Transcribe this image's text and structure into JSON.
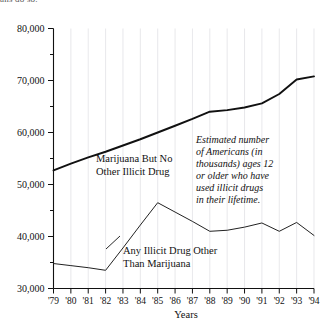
{
  "top_clipped_text": "ans do so.",
  "chart_data": {
    "type": "line",
    "title": "",
    "xlabel": "Years",
    "ylabel": "",
    "x": [
      "'79",
      "'80",
      "'81",
      "'82",
      "'83",
      "'84",
      "'85",
      "'86",
      "'87",
      "'88",
      "'89",
      "'90",
      "'91",
      "'92",
      "'93",
      "'94"
    ],
    "ylim": [
      30000,
      80000
    ],
    "ytick_values": [
      30000,
      40000,
      50000,
      60000,
      70000,
      80000
    ],
    "ytick_labels": [
      "30,000",
      "40,000",
      "50,000",
      "60,000",
      "70,000",
      "80,000"
    ],
    "yminor_values": [
      35000,
      45000,
      55000,
      65000,
      75000
    ],
    "grid": "vertical-only",
    "legend": "inline-labels",
    "series": [
      {
        "name": "Marijuana But No Other Illicit Drug",
        "values": [
          52700,
          54000,
          55200,
          56300,
          57500,
          58700,
          60000,
          61300,
          62600,
          64000,
          64300,
          64800,
          65600,
          67400,
          70200,
          70800
        ]
      },
      {
        "name": "Any Illicit Drug Other Than Marijuana",
        "values": [
          34800,
          34400,
          34000,
          33500,
          37800,
          42200,
          46500,
          44700,
          42900,
          41000,
          41200,
          41800,
          42600,
          41000,
          42700,
          40200
        ]
      }
    ],
    "annotations": [
      {
        "name": "estimate-note",
        "lines": [
          "Estimated number",
          "of Americans (in",
          "thousands) ages 12",
          "or older who have",
          "used illicit drugs",
          "in their lifetime."
        ]
      }
    ],
    "series_labels": [
      {
        "name": "upper",
        "lines": [
          "Marijuana But No",
          "Other Illicit Drug"
        ]
      },
      {
        "name": "lower",
        "lines": [
          "Any Illicit Drug Other",
          "Than Marijuana"
        ]
      }
    ]
  },
  "colors": {
    "line": "#111111",
    "grid": "#d9d9dd",
    "axis": "#111111",
    "background": "#ffffff"
  }
}
